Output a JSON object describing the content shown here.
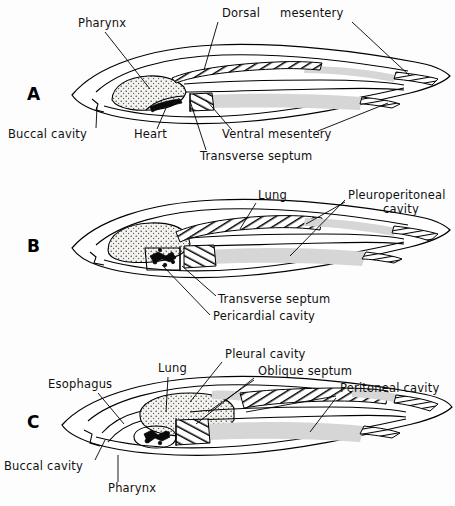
{
  "figure": {
    "background_color": "#fdfdfd",
    "ink_color": "#111111",
    "cavity_fill": "#d2d2d2",
    "width": 455,
    "height": 506
  },
  "panels": [
    {
      "id": "A",
      "letter": "A",
      "labels": [
        {
          "text": "Pharynx",
          "x": 78,
          "y": 27,
          "anchor": "start"
        },
        {
          "text": "Dorsal",
          "x": 222,
          "y": 17,
          "anchor": "start"
        },
        {
          "text": "mesentery",
          "x": 280,
          "y": 17,
          "anchor": "start"
        },
        {
          "text": "Buccal cavity",
          "x": 8,
          "y": 138,
          "anchor": "start"
        },
        {
          "text": "Heart",
          "x": 134,
          "y": 138,
          "anchor": "start"
        },
        {
          "text": "Ventral mesentery",
          "x": 222,
          "y": 138,
          "anchor": "start"
        },
        {
          "text": "Transverse septum",
          "x": 200,
          "y": 160,
          "anchor": "start"
        }
      ]
    },
    {
      "id": "B",
      "letter": "B",
      "labels": [
        {
          "text": "Lung",
          "x": 258,
          "y": 199,
          "anchor": "start"
        },
        {
          "text": "Pleuroperitoneal",
          "x": 348,
          "y": 199,
          "anchor": "start"
        },
        {
          "text": "cavity",
          "x": 383,
          "y": 213,
          "anchor": "start"
        },
        {
          "text": "Transverse septum",
          "x": 218,
          "y": 303,
          "anchor": "start"
        },
        {
          "text": "Pericardial cavity",
          "x": 213,
          "y": 320,
          "anchor": "start"
        }
      ]
    },
    {
      "id": "C",
      "letter": "C",
      "labels": [
        {
          "text": "Pleural cavity",
          "x": 225,
          "y": 358,
          "anchor": "start"
        },
        {
          "text": "Lung",
          "x": 158,
          "y": 372,
          "anchor": "start"
        },
        {
          "text": "Oblique septum",
          "x": 258,
          "y": 375,
          "anchor": "start"
        },
        {
          "text": "Esophagus",
          "x": 48,
          "y": 388,
          "anchor": "start"
        },
        {
          "text": "Peritoneal cavity",
          "x": 340,
          "y": 392,
          "anchor": "start"
        },
        {
          "text": "Buccal cavity",
          "x": 4,
          "y": 470,
          "anchor": "start"
        },
        {
          "text": "Pharynx",
          "x": 108,
          "y": 492,
          "anchor": "start"
        }
      ]
    }
  ],
  "anatomy_terms": [
    "Pharynx",
    "Dorsal mesentery",
    "Buccal cavity",
    "Heart",
    "Ventral mesentery",
    "Transverse septum",
    "Lung",
    "Pleuroperitoneal cavity",
    "Pericardial cavity",
    "Pleural cavity",
    "Oblique septum",
    "Esophagus",
    "Peritoneal cavity"
  ]
}
